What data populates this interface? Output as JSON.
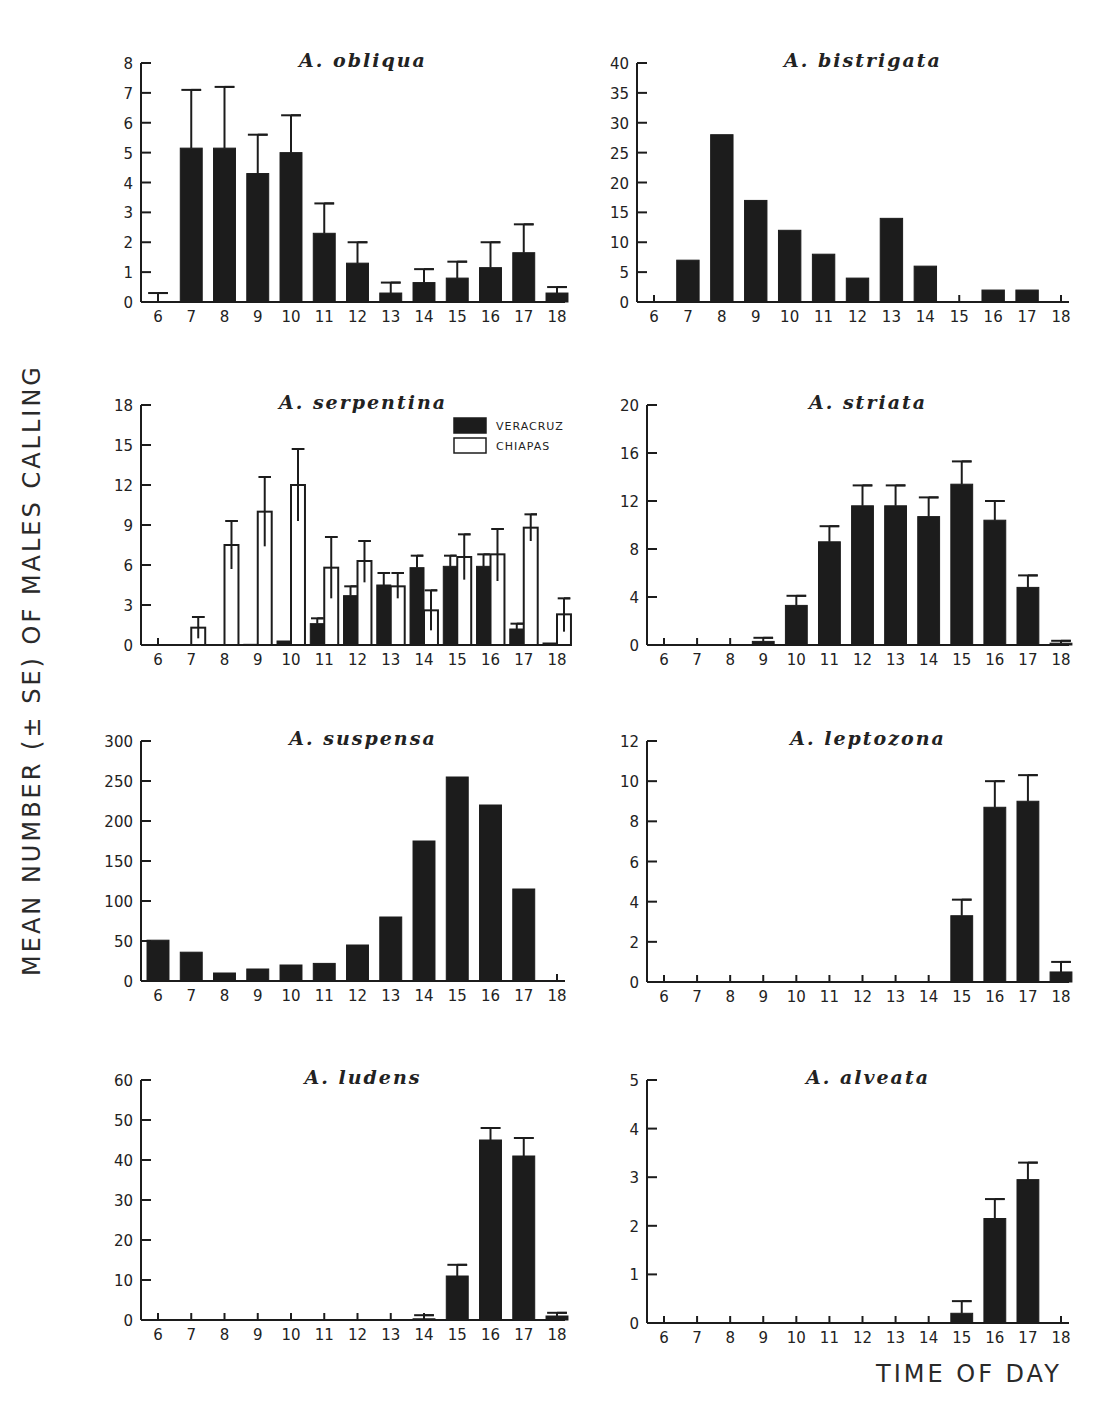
{
  "figure": {
    "ylabel": "MEAN NUMBER (± SE) OF MALES CALLING",
    "xlabel": "TIME OF DAY",
    "colors": {
      "bar_fill": "#1c1c1c",
      "open_fill": "#ffffff",
      "axis": "#1c1c1c"
    }
  },
  "chart_data": [
    {
      "type": "bar",
      "title": "A. obliqua",
      "categories": [
        "6",
        "7",
        "8",
        "9",
        "10",
        "11",
        "12",
        "13",
        "14",
        "15",
        "16",
        "17",
        "18"
      ],
      "yticks": [
        0,
        1,
        2,
        3,
        4,
        5,
        6,
        7,
        8
      ],
      "ylim": [
        0,
        8
      ],
      "series": [
        {
          "name": "mean",
          "style": "filled",
          "values": [
            0,
            5.15,
            5.15,
            4.3,
            5.0,
            2.3,
            1.3,
            0.3,
            0.65,
            0.8,
            1.15,
            1.65,
            0.3
          ],
          "se_top": [
            0.3,
            7.1,
            7.2,
            5.6,
            6.25,
            3.3,
            2.0,
            0.65,
            1.1,
            1.35,
            2.0,
            2.6,
            0.5
          ]
        }
      ]
    },
    {
      "type": "bar",
      "title": "A. bistrigata",
      "categories": [
        "6",
        "7",
        "8",
        "9",
        "10",
        "11",
        "12",
        "13",
        "14",
        "15",
        "16",
        "17",
        "18"
      ],
      "yticks": [
        0,
        5,
        10,
        15,
        20,
        25,
        30,
        35,
        40
      ],
      "ylim": [
        0,
        40
      ],
      "series": [
        {
          "name": "mean",
          "style": "filled",
          "values": [
            0,
            7,
            28,
            17,
            12,
            8,
            4,
            14,
            6,
            0,
            2,
            2,
            0
          ],
          "se_top": [
            null,
            null,
            null,
            null,
            null,
            null,
            null,
            null,
            null,
            null,
            null,
            null,
            null
          ]
        }
      ]
    },
    {
      "type": "bar",
      "title": "A. serpentina",
      "categories": [
        "6",
        "7",
        "8",
        "9",
        "10",
        "11",
        "12",
        "13",
        "14",
        "15",
        "16",
        "17",
        "18"
      ],
      "yticks": [
        0,
        3,
        6,
        9,
        12,
        15,
        18
      ],
      "ylim": [
        0,
        18
      ],
      "legend": [
        {
          "label": "VERACRUZ",
          "style": "filled"
        },
        {
          "label": "CHIAPAS",
          "style": "open"
        }
      ],
      "series": [
        {
          "name": "VERACRUZ",
          "style": "filled",
          "values": [
            0,
            0,
            0,
            0.05,
            0.3,
            1.6,
            3.7,
            4.5,
            5.8,
            5.9,
            5.9,
            1.2,
            0.15
          ],
          "se_top": [
            null,
            null,
            null,
            null,
            null,
            2.0,
            4.4,
            5.4,
            6.7,
            6.7,
            6.8,
            1.6,
            null
          ]
        },
        {
          "name": "CHIAPAS",
          "style": "open",
          "values": [
            0,
            1.3,
            7.5,
            10.0,
            12.0,
            5.8,
            6.3,
            4.4,
            2.6,
            6.6,
            6.8,
            8.8,
            2.3
          ],
          "se_top": [
            null,
            2.1,
            9.3,
            12.6,
            14.7,
            8.1,
            7.8,
            5.4,
            4.1,
            8.3,
            8.7,
            9.8,
            3.5
          ],
          "se_bottom": [
            null,
            0.5,
            5.7,
            7.4,
            9.3,
            3.5,
            4.7,
            3.5,
            1.1,
            4.9,
            4.8,
            7.8,
            1.0
          ]
        }
      ]
    },
    {
      "type": "bar",
      "title": "A. striata",
      "categories": [
        "6",
        "7",
        "8",
        "9",
        "10",
        "11",
        "12",
        "13",
        "14",
        "15",
        "16",
        "17",
        "18"
      ],
      "yticks": [
        0,
        4,
        8,
        12,
        16,
        20
      ],
      "ylim": [
        0,
        20
      ],
      "series": [
        {
          "name": "mean",
          "style": "filled",
          "values": [
            0,
            0,
            0,
            0.3,
            3.3,
            8.6,
            11.6,
            11.6,
            10.7,
            13.4,
            10.4,
            4.8,
            0.15
          ],
          "se_top": [
            null,
            null,
            null,
            0.6,
            4.1,
            9.9,
            13.3,
            13.3,
            12.3,
            15.3,
            12.0,
            5.8,
            0.35
          ]
        }
      ]
    },
    {
      "type": "bar",
      "title": "A. suspensa",
      "categories": [
        "6",
        "7",
        "8",
        "9",
        "10",
        "11",
        "12",
        "13",
        "14",
        "15",
        "16",
        "17",
        "18"
      ],
      "yticks": [
        0,
        50,
        100,
        150,
        200,
        250,
        300
      ],
      "ylim": [
        0,
        300
      ],
      "series": [
        {
          "name": "mean",
          "style": "filled",
          "values": [
            51,
            36,
            10,
            15,
            20,
            22,
            45,
            80,
            175,
            255,
            220,
            115,
            0
          ],
          "se_top": [
            null,
            null,
            null,
            null,
            null,
            null,
            null,
            null,
            null,
            null,
            null,
            null,
            null
          ]
        }
      ]
    },
    {
      "type": "bar",
      "title": "A. leptozona",
      "categories": [
        "6",
        "7",
        "8",
        "9",
        "10",
        "11",
        "12",
        "13",
        "14",
        "15",
        "16",
        "17",
        "18"
      ],
      "yticks": [
        0,
        2,
        4,
        6,
        8,
        10,
        12
      ],
      "ylim": [
        0,
        12
      ],
      "series": [
        {
          "name": "mean",
          "style": "filled",
          "values": [
            0,
            0,
            0,
            0,
            0,
            0,
            0,
            0,
            0,
            3.3,
            8.7,
            9.0,
            0.5
          ],
          "se_top": [
            null,
            null,
            null,
            null,
            null,
            null,
            null,
            null,
            null,
            4.1,
            10.0,
            10.3,
            1.0
          ]
        }
      ]
    },
    {
      "type": "bar",
      "title": "A. ludens",
      "categories": [
        "6",
        "7",
        "8",
        "9",
        "10",
        "11",
        "12",
        "13",
        "14",
        "15",
        "16",
        "17",
        "18"
      ],
      "yticks": [
        0,
        10,
        20,
        30,
        40,
        50,
        60
      ],
      "ylim": [
        0,
        60
      ],
      "series": [
        {
          "name": "mean",
          "style": "filled",
          "values": [
            0,
            0,
            0,
            0,
            0,
            0,
            0,
            0,
            0.3,
            11,
            45,
            41,
            1.0
          ],
          "se_top": [
            null,
            null,
            null,
            null,
            null,
            null,
            null,
            null,
            1.2,
            13.8,
            48,
            45.5,
            1.8
          ]
        }
      ]
    },
    {
      "type": "bar",
      "title": "A. alveata",
      "categories": [
        "6",
        "7",
        "8",
        "9",
        "10",
        "11",
        "12",
        "13",
        "14",
        "15",
        "16",
        "17",
        "18"
      ],
      "yticks": [
        0,
        1,
        2,
        3,
        4,
        5
      ],
      "ylim": [
        0,
        5
      ],
      "series": [
        {
          "name": "mean",
          "style": "filled",
          "values": [
            0,
            0,
            0,
            0,
            0,
            0,
            0,
            0,
            0,
            0.2,
            2.15,
            2.95,
            0
          ],
          "se_top": [
            null,
            null,
            null,
            null,
            null,
            null,
            null,
            null,
            null,
            0.45,
            2.55,
            3.3,
            null
          ]
        }
      ]
    }
  ]
}
